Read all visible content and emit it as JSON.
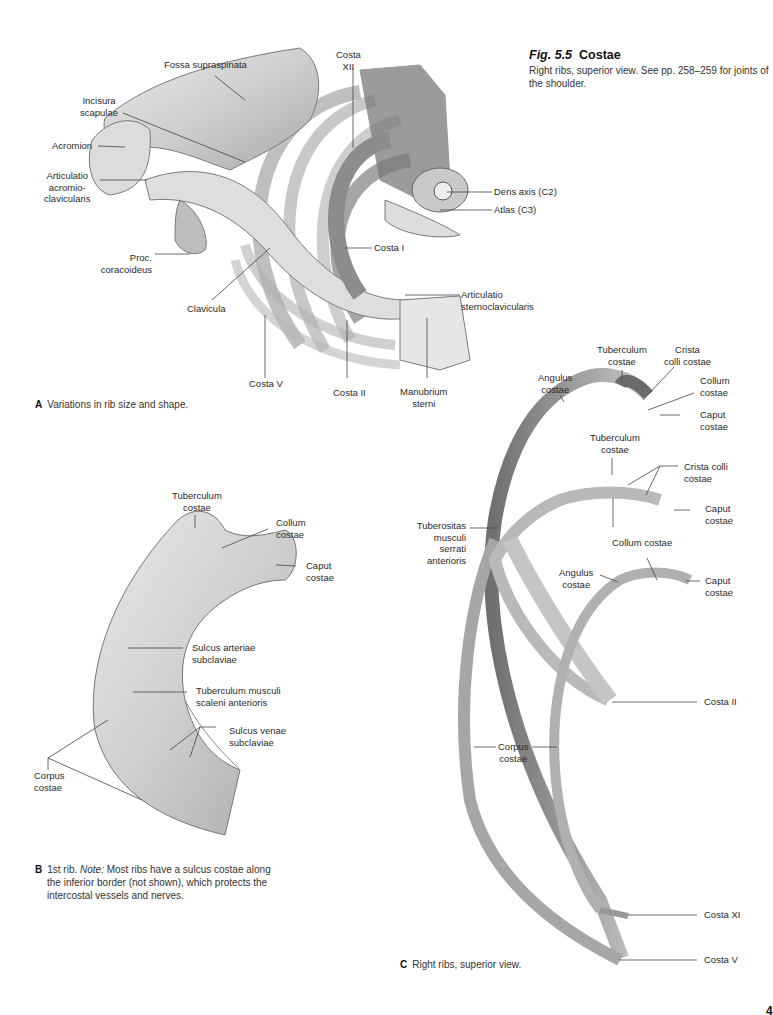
{
  "figure": {
    "number": "Fig. 5.5",
    "title": "Costae",
    "description": "Right ribs, superior view. See pp. 258–259 for joints of the shoulder."
  },
  "panels": {
    "A": {
      "letter": "A",
      "caption": "Variations in rib size and shape.",
      "labels": {
        "fossa_supraspinata": "Fossa supraspinata",
        "costa_xii": [
          "Costa",
          "XII"
        ],
        "incisura_scapulae": [
          "Incisura",
          "scapulae"
        ],
        "acromion": "Acromion",
        "articulatio_ac": [
          "Articulatio",
          "acromio-",
          "clavicularis"
        ],
        "dens_axis": "Dens axis (C2)",
        "atlas": "Atlas (C3)",
        "costa_i": "Costa I",
        "proc_coracoideus": [
          "Proc.",
          "coracoideus"
        ],
        "clavicula": "Clavicula",
        "articulatio_sc": [
          "Articulatio",
          "sternoclavicularis"
        ],
        "costa_v": "Costa V",
        "costa_ii": "Costa II",
        "manubrium": [
          "Manubrium",
          "sterni"
        ]
      }
    },
    "B": {
      "letter": "B",
      "caption_lead": "1st rib.",
      "caption_note_label": "Note:",
      "caption_text": "Most ribs have a sulcus costae along the inferior border (not shown), which protects the intercostal vessels and nerves.",
      "labels": {
        "tuberculum": [
          "Tuberculum",
          "costae"
        ],
        "collum": [
          "Collum",
          "costae"
        ],
        "caput": [
          "Caput",
          "costae"
        ],
        "sulcus_arteriae": [
          "Sulcus arteriae",
          "subclaviae"
        ],
        "tuberculum_scaleni": [
          "Tuberculum musculi",
          "scaleni anterioris"
        ],
        "sulcus_venae": [
          "Sulcus venae",
          "subclaviae"
        ],
        "corpus": [
          "Corpus",
          "costae"
        ]
      }
    },
    "C": {
      "letter": "C",
      "caption": "Right ribs, superior view.",
      "labels": {
        "angulus_1": [
          "Angulus",
          "costae"
        ],
        "tuberculum_1": [
          "Tuberculum",
          "costae"
        ],
        "crista_1": [
          "Crista",
          "colli costae"
        ],
        "collum_1": [
          "Collum",
          "costae"
        ],
        "caput_1": [
          "Caput",
          "costae"
        ],
        "tuberculum_2": [
          "Tuberculum",
          "costae"
        ],
        "crista_2": [
          "Crista colli",
          "costae"
        ],
        "caput_2": [
          "Caput",
          "costae"
        ],
        "tuberositas": [
          "Tuberositas",
          "musculi",
          "serrati",
          "anterioris"
        ],
        "collum_2": "Collum costae",
        "angulus_2": [
          "Angulus",
          "costae"
        ],
        "caput_3": [
          "Caput",
          "costae"
        ],
        "costa_ii": "Costa II",
        "corpus": [
          "Corpus",
          "costae"
        ],
        "costa_xi": "Costa XI",
        "costa_v": "Costa V"
      }
    }
  },
  "page_number": "4"
}
